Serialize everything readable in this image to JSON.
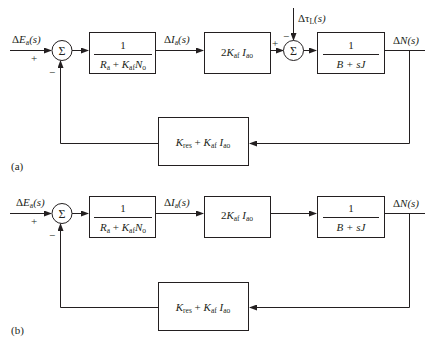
{
  "diagrams": [
    {
      "id": "a",
      "caption": "(a)",
      "input": {
        "delta": "Δ",
        "var": "E",
        "sub": "a",
        "arg": "(s)",
        "sign": "+"
      },
      "sum1": {
        "symbol": "Σ",
        "feedback_sign": "−"
      },
      "block1": {
        "num": "1",
        "den_R": "R",
        "den_R_sub": "a",
        "den_plus": " + ",
        "den_K": "K",
        "den_K_sub": "af",
        "den_N": "N",
        "den_N_sub": "o"
      },
      "current": {
        "delta": "Δ",
        "var": "I",
        "sub": "a",
        "arg": "(s)"
      },
      "block2": {
        "coef": "2",
        "K": "K",
        "K_sub": "af",
        "I": "I",
        "I_sub": "ao"
      },
      "disturbance": {
        "delta": "Δτ",
        "sub": "L",
        "arg": "(s)",
        "sign": "−"
      },
      "sum2": {
        "symbol": "Σ",
        "plus_sign": "+"
      },
      "block3": {
        "num": "1",
        "den": "B + sJ"
      },
      "output": {
        "delta": "Δ",
        "var": "N",
        "arg": "(s)"
      },
      "feedback": {
        "K": "K",
        "K_sub": "res",
        "plus": " + ",
        "K2": "K",
        "K2_sub": "af",
        "I": "I",
        "I_sub": "ao"
      }
    },
    {
      "id": "b",
      "caption": "(b)",
      "input": {
        "delta": "Δ",
        "var": "E",
        "sub": "a",
        "arg": "(s)",
        "sign": "+"
      },
      "sum1": {
        "symbol": "Σ",
        "feedback_sign": "−"
      },
      "block1": {
        "num": "1",
        "den_R": "R",
        "den_R_sub": "a",
        "den_plus": " + ",
        "den_K": "K",
        "den_K_sub": "af",
        "den_N": "N",
        "den_N_sub": "o"
      },
      "current": {
        "delta": "Δ",
        "var": "I",
        "sub": "a",
        "arg": "(s)"
      },
      "block2": {
        "coef": "2",
        "K": "K",
        "K_sub": "af",
        "I": "I",
        "I_sub": "ao"
      },
      "block3": {
        "num": "1",
        "den": "B + sJ"
      },
      "output": {
        "delta": "Δ",
        "var": "N",
        "arg": "(s)"
      },
      "feedback": {
        "K": "K",
        "K_sub": "res",
        "plus": " + ",
        "K2": "K",
        "K2_sub": "af",
        "I": "I",
        "I_sub": "ao"
      }
    }
  ]
}
